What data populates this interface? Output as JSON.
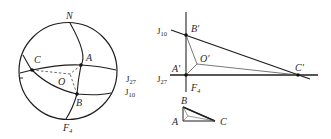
{
  "figure": {
    "left_diagram": {
      "description": "Stereographic projection net (circle) with great circles and points",
      "labels": {
        "N": "N",
        "A": "A",
        "B": "B",
        "C": "C",
        "O": "O",
        "F": "F",
        "F_sub": "4",
        "J27": "J",
        "J27_sub": "27",
        "J10": "J",
        "J10_sub": "10"
      }
    },
    "right_diagram": {
      "description": "Triangle projection construction with intersecting planes",
      "labels": {
        "A_prime": "A′",
        "B_prime": "B′",
        "C_prime": "C′",
        "O_prime": "O′",
        "F": "F",
        "F_sub": "4",
        "J10": "J",
        "J10_sub": "10",
        "J27": "J",
        "J27_sub": "27"
      },
      "small_triangle": {
        "A": "A",
        "B": "B",
        "C": "C"
      }
    },
    "colors": {
      "line": "#1e1e1e",
      "thin_line": "#555555",
      "background": "#ffffff"
    }
  }
}
